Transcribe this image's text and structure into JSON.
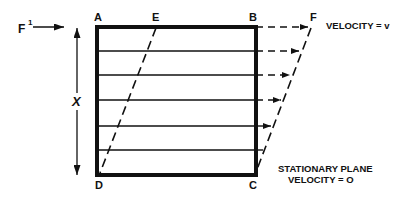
{
  "diagram": {
    "force_label": "F",
    "force_superscript": "1",
    "distance_label": "X",
    "corners": {
      "top_left": "A",
      "top_mid": "E",
      "top_right": "B",
      "shear_top": "F",
      "bottom_left": "D",
      "bottom_right": "C"
    },
    "moving_plane_label": "VELOCITY = v",
    "stationary_plane_label_line1": "STATIONARY PLANE",
    "stationary_plane_label_line2": "VELOCITY = O",
    "layer_count": 6,
    "colors": {
      "ink": "#111111",
      "background": "#ffffff"
    }
  }
}
